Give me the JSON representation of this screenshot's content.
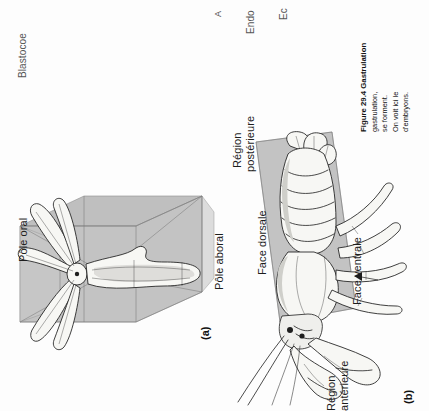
{
  "page": {
    "width": 429,
    "height": 411,
    "orientation": "rotated-90-ccw",
    "background_color": "#fdfdfd",
    "ink_color": "#1e1e1e",
    "plane_color": "#b4b4b4"
  },
  "clipped_labels_from_previous_figure": [
    {
      "name": "blastocoel",
      "text": "Blastocoe"
    },
    {
      "name": "archenteron",
      "text": "A"
    },
    {
      "name": "endoderm",
      "text": "Endo"
    },
    {
      "name": "ectoderm",
      "text": "Ec"
    }
  ],
  "panels": [
    {
      "tag": "(a)",
      "name": "radial-symmetry-sea-star",
      "subject": "sea star",
      "symmetry": "radial",
      "labels": [
        {
          "name": "oral-pole",
          "text": "Pôle oral"
        },
        {
          "name": "aboral-pole",
          "text": "Pôle aboral"
        }
      ]
    },
    {
      "tag": "(b)",
      "name": "bilateral-symmetry-lobster",
      "subject": "lobster",
      "symmetry": "bilateral",
      "labels": [
        {
          "name": "posterior-region",
          "text": "Région\npostérieure"
        },
        {
          "name": "dorsal-surface",
          "text": "Face dorsale"
        },
        {
          "name": "ventral-surface",
          "text": "Face ventrale"
        },
        {
          "name": "anterior-region",
          "text": "Région\nantérieure"
        }
      ]
    }
  ],
  "panel_labels": {
    "a": "(a)",
    "b": "(b)"
  },
  "figure_labels": {
    "pole_oral": "Pôle oral",
    "pole_aboral": "Pôle aboral",
    "region_posterieure_l1": "Région",
    "region_posterieure_l2": "postérieure",
    "face_dorsale": "Face dorsale",
    "face_ventrale": "Face ventrale",
    "region_anterieure_l1": "Région",
    "region_anterieure_l2": "antérieure"
  },
  "caption": {
    "number": "Figure 29.4",
    "title": "Gastrulation",
    "body": "gastrulation, se forment. On voit ici le d'embryons.",
    "line1": "Figure 29.4",
    "line2": "Gastrulation",
    "line3": "gastrulation,",
    "line4": "se forment.",
    "line5": "On voit ici le",
    "line6": "d'embryons."
  }
}
